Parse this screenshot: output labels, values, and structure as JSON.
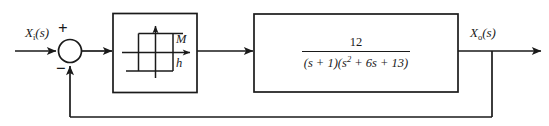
{
  "diagram": {
    "type": "control-system-block-diagram",
    "colors": {
      "line": "#1a1a1a",
      "background": "#ffffff",
      "text": "#1a1a1a"
    },
    "input_signal": {
      "base": "X",
      "subscript": "i",
      "argument": "(s)",
      "full": "Xi(s)"
    },
    "output_signal": {
      "base": "X",
      "subscript": "o",
      "argument": "(s)",
      "full": "Xo(s)"
    },
    "summing_junction": {
      "name": "summing-junction",
      "positive_sign": "+",
      "negative_sign": "−"
    },
    "nonlinearity_block": {
      "name": "hysteresis-relay-nonlinearity",
      "output_level_label": "M",
      "hysteresis_width_label": "h",
      "description": "relay with hysteresis characteristic"
    },
    "transfer_function_block": {
      "name": "linear-plant-transfer-function",
      "numerator": "12",
      "denominator_parts": {
        "first_factor": "(s + 1)",
        "second_factor_lead": "(s",
        "second_factor_exponent": "2",
        "second_factor_rest": " + 6s + 13)"
      },
      "denominator_full": "(s + 1)(s² + 6s + 13)",
      "expression": "12 / ((s + 1)(s² + 6s + 13))"
    },
    "feedback_path": {
      "name": "unity-feedback-path",
      "gain": "1",
      "sign": "negative"
    }
  }
}
